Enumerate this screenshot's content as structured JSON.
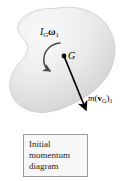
{
  "figure": {
    "title": "Initial momentum diagram",
    "background_color": "#ffffff"
  },
  "body_shape": {
    "name": "rigid-body-blob",
    "description": "kidney shaped rigid body",
    "fill_light": "#fbfbfb",
    "fill_mid": "#e9e9e9",
    "fill_dark": "#cfcfcf",
    "outline_color": "#bdbdbd"
  },
  "labels": {
    "angular_momentum": {
      "text": "I_G ω_1",
      "symbol": "I",
      "subscript": "G",
      "omega": "ω",
      "omega_subscript": "1"
    },
    "center_of_mass": {
      "text": "G"
    },
    "linear_momentum": {
      "text": "m(v_G)_1",
      "mass_symbol": "m",
      "open_paren": "(",
      "velocity_symbol": "v",
      "velocity_subscript": "G",
      "close_paren": ")",
      "state_subscript": "1"
    }
  },
  "arrows": {
    "rotation_arrow": {
      "name": "angular-velocity-arrow",
      "direction": "clockwise-sweep-ending-lower-left",
      "color": "#4a4a4a"
    },
    "momentum_vector": {
      "name": "linear-momentum-vector",
      "direction": "down-right",
      "color": "#000000",
      "start": "G",
      "tip_x": 88,
      "tip_y": 113
    }
  },
  "center_point": {
    "name": "center-of-mass-dot",
    "x": 64,
    "y": 56,
    "color": "#000000"
  },
  "caption": {
    "line1": "Initial",
    "line2": "momentum",
    "line3": "diagram",
    "full_text": "Initial\nmomentum\ndiagram",
    "border_color": "#9a9a9a",
    "background_color": "#f7f7f7"
  }
}
